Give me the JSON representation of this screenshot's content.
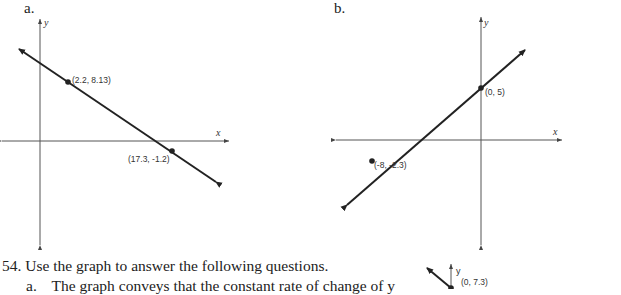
{
  "graphs": [
    {
      "label": "a.",
      "x_axis_label": "x",
      "y_axis_label": "y",
      "points": [
        {
          "label": "(2.2, 8.13)",
          "x": 2.2,
          "y": 8.13
        },
        {
          "label": "(17.3, -1.2)",
          "x": 17.3,
          "y": -1.2
        }
      ]
    },
    {
      "label": "b.",
      "x_axis_label": "x",
      "y_axis_label": "y",
      "points": [
        {
          "label": "(0, 5)",
          "x": 0,
          "y": 5
        },
        {
          "label": "(-8, -2.3)",
          "x": -8,
          "y": -2.3
        }
      ]
    },
    {
      "label": "",
      "y_axis_label": "y",
      "points": [
        {
          "label": "(0, 7.3)",
          "x": 0,
          "y": 7.3
        }
      ]
    }
  ],
  "question": {
    "number": "54.",
    "text": "Use the graph to answer the following questions.",
    "sub_label": "a.",
    "sub_text": "The graph conveys that the constant rate of change of y"
  }
}
